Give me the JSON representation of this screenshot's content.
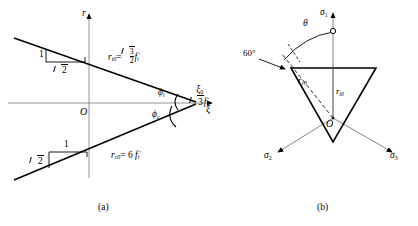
{
  "figure": {
    "panels": [
      {
        "id": "a",
        "caption": "(a)",
        "axes": {
          "vertical": "r",
          "horizontal": "ξ",
          "origin": "O"
        },
        "labels": {
          "tensile_meridian": {
            "symbol": "r",
            "subscript": "t0",
            "equals": "=",
            "coefficient_num": "3",
            "coefficient_den": "2",
            "strength": "f",
            "strength_sub": "t",
            "strength_prime": "′"
          },
          "compressive_meridian": {
            "symbol": "r",
            "subscript": "c0",
            "equals": "= 6",
            "strength": "f",
            "strength_sub": "t",
            "strength_prime": "′"
          },
          "apex": {
            "symbol": "ξ",
            "subscript": "0",
            "equals": "=",
            "value_radicand": "3",
            "strength": "f",
            "strength_sub": "t",
            "strength_prime": "′"
          },
          "angle_tensile": {
            "symbol": "ϕ",
            "subscript": "t"
          },
          "angle_compressive": {
            "symbol": "ϕ",
            "subscript": "c"
          },
          "slope_upper": {
            "rise": "1",
            "run_radicand": "2"
          },
          "slope_lower": {
            "rise": "1",
            "run_radicand": "2"
          }
        }
      },
      {
        "id": "b",
        "caption": "(b)",
        "axes": {
          "sigma1": {
            "symbol": "σ",
            "subscript": "1"
          },
          "sigma2": {
            "symbol": "σ",
            "subscript": "2"
          },
          "sigma3": {
            "symbol": "σ",
            "subscript": "3"
          }
        },
        "labels": {
          "origin": "O",
          "angle_60": "60°",
          "angle_theta": "θ",
          "radius_compressive": {
            "symbol": "r",
            "subscript": "c0"
          },
          "radius_tensile": {
            "symbol": "r",
            "subscript": "t0"
          }
        }
      }
    ]
  },
  "colors": {
    "stroke": "#000000",
    "thin_stroke": "#5a5a5a",
    "background": "#ffffff"
  }
}
